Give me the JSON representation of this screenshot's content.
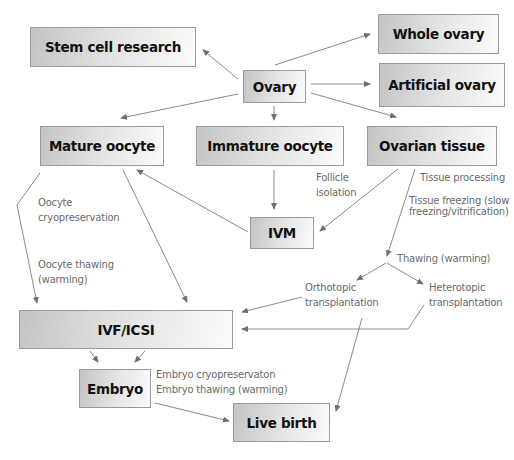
{
  "nodes": {
    "stem_cell_research": "Stem cell research",
    "whole_ovary": "Whole ovary",
    "ovary": "Ovary",
    "artificial_ovary": "Artificial ovary",
    "mature_oocyte": "Mature oocyte",
    "immature_oocyte": "Immature oocyte",
    "ovarian_tissue": "Ovarian tissue",
    "ivm": "IVM",
    "ivf_icsi": "IVF/ICSI",
    "embryo": "Embryo",
    "live_birth": "Live birth"
  },
  "labels": {
    "oocyte_cryo_1": "Oocyte",
    "oocyte_cryo_2": "cryopreservation",
    "oocyte_thaw_1": "Oocyte thawing",
    "oocyte_thaw_2": "(warming)",
    "follicle_1": "Follicle",
    "follicle_2": "isolation",
    "tissue_processing": "Tissue processing",
    "tissue_freezing_1": "Tissue freezing (slow",
    "tissue_freezing_2": "freezing/vitrification)",
    "thawing": "Thawing (warming)",
    "orthotopic_1": "Orthotopic",
    "orthotopic_2": "transplantation",
    "heterotopic_1": "Heterotopic",
    "heterotopic_2": "transplantation",
    "embryo_cryo": "Embryo cryopreservaton",
    "embryo_thaw": "Embryo thawing (warming)"
  },
  "colors": {
    "arrow": "#7a7a7a",
    "box_border": "#9a9a9a",
    "label_text": "#6a6a6a"
  }
}
